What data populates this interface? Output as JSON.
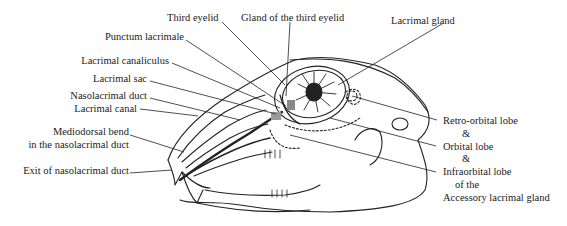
{
  "diagram": {
    "labels_left": [
      {
        "id": "punctum",
        "text": "Punctum lacrimale"
      },
      {
        "id": "canaliculus",
        "text": "Lacrimal canaliculus"
      },
      {
        "id": "sac",
        "text": "Lacrimal sac"
      },
      {
        "id": "nld",
        "text": "Nasolacrimal duct"
      },
      {
        "id": "canal",
        "text": "Lacrimal canal"
      },
      {
        "id": "bend1",
        "text": "Mediodorsal bend"
      },
      {
        "id": "bend2",
        "text": "in the nasolacrimal duct"
      },
      {
        "id": "exit",
        "text": "Exit of nasolacrimal duct"
      }
    ],
    "labels_top": [
      {
        "id": "third_eyelid",
        "text": "Third eyelid"
      },
      {
        "id": "gland_third",
        "text": "Gland of the third eyelid"
      },
      {
        "id": "lacrimal_gland",
        "text": "Lacrimal gland"
      }
    ],
    "labels_right": [
      {
        "id": "retro",
        "text": "Retro-orbital lobe"
      },
      {
        "id": "amp1",
        "text": "&"
      },
      {
        "id": "orbital",
        "text": "Orbital lobe"
      },
      {
        "id": "amp2",
        "text": "&"
      },
      {
        "id": "infra",
        "text": "Infraorbital lobe"
      },
      {
        "id": "ofthe",
        "text": "of the"
      },
      {
        "id": "accessory",
        "text": "Accessory lacrimal gland"
      }
    ]
  }
}
